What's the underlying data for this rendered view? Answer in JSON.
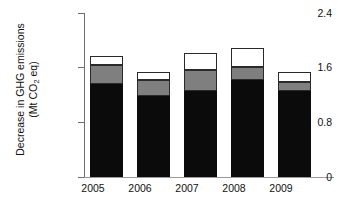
{
  "chart_data": {
    "type": "bar",
    "stacked": true,
    "title": "",
    "xlabel": "",
    "ylabel": "Decrease in GHG emissions (Mt CO2 eq)",
    "ylabel_line1": "Decrease in GHG emissions",
    "ylabel_line2_prefix": "(Mt CO",
    "ylabel_line2_sub": "2",
    "ylabel_line2_suffix": " eq)",
    "categories": [
      "2005",
      "2006",
      "2007",
      "2008",
      "2009"
    ],
    "ylim": [
      0,
      2.4
    ],
    "ytick_values": [
      0,
      0.8,
      1.6,
      2.4
    ],
    "ytick_labels": [
      "0",
      "0.8",
      "1.6",
      "2.4"
    ],
    "grid": false,
    "legend": "none",
    "series": [
      {
        "name": "black-segment",
        "color": "#0b0b0b",
        "values": [
          1.36,
          1.19,
          1.26,
          1.42,
          1.26
        ]
      },
      {
        "name": "gray-segment",
        "color": "#7f7f7f",
        "values": [
          0.28,
          0.23,
          0.31,
          0.19,
          0.13
        ]
      },
      {
        "name": "white-segment",
        "color": "#ffffff",
        "values": [
          0.13,
          0.12,
          0.25,
          0.28,
          0.15
        ]
      }
    ],
    "totals": [
      1.77,
      1.54,
      1.82,
      1.89,
      1.54
    ]
  },
  "axis": {
    "y_tick_0": "0",
    "y_tick_1": "0.8",
    "y_tick_2": "1.6",
    "y_tick_3": "2.4",
    "x_tick_0": "2005",
    "x_tick_1": "2006",
    "x_tick_2": "2007",
    "x_tick_3": "2008",
    "x_tick_4": "2009"
  }
}
